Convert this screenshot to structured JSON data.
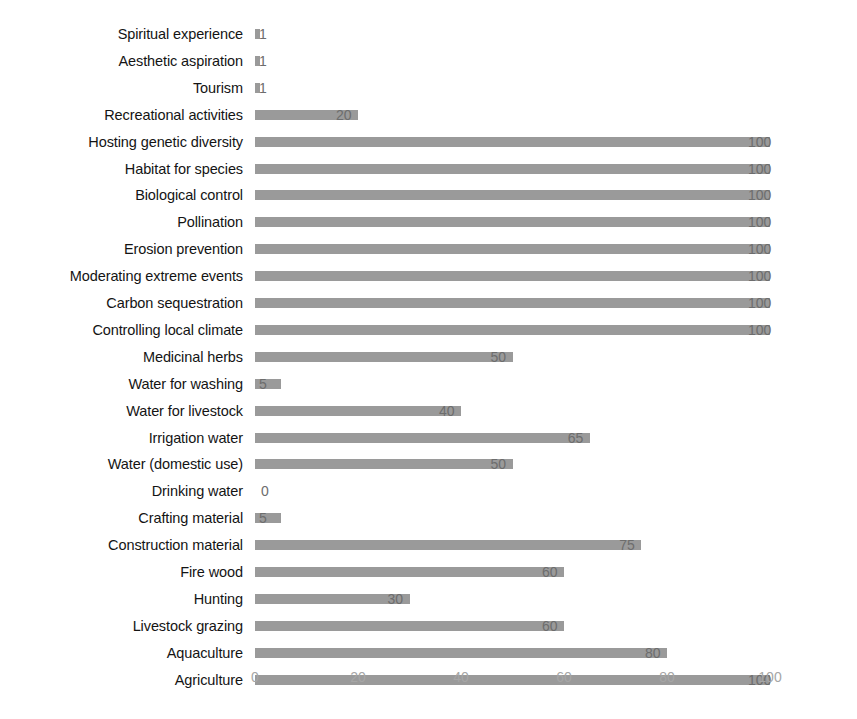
{
  "chart_data": {
    "type": "bar",
    "orientation": "horizontal",
    "title": "",
    "xlabel": "",
    "ylabel": "",
    "xlim": [
      0,
      100
    ],
    "xticks": [
      "0",
      "20",
      "40",
      "60",
      "80",
      "100"
    ],
    "xtick_values": [
      0,
      20,
      40,
      60,
      80,
      100
    ],
    "grid": false,
    "legend": false,
    "bar_color": "#9a9a9a",
    "label_color": "#141414",
    "value_label_color": "#6d6d6d",
    "tick_label_color": "#a6a6a6",
    "categories": [
      "Spiritual experience",
      "Aesthetic aspiration",
      "Tourism",
      "Recreational activities",
      "Hosting genetic diversity",
      "Habitat for species",
      "Biological control",
      "Pollination",
      "Erosion prevention",
      "Moderating extreme events",
      "Carbon sequestration",
      "Controlling local climate",
      "Medicinal herbs",
      "Water for washing",
      "Water for livestock",
      "Irrigation water",
      "Water (domestic use)",
      "Drinking water",
      "Crafting material",
      "Construction material",
      "Fire wood",
      "Hunting",
      "Livestock grazing",
      "Aquaculture",
      "Agriculture"
    ],
    "values": [
      1,
      1,
      1,
      20,
      100,
      100,
      100,
      100,
      100,
      100,
      100,
      100,
      50,
      5,
      40,
      65,
      50,
      0,
      5,
      75,
      60,
      30,
      60,
      80,
      100
    ],
    "value_labels": [
      "1",
      "1",
      "1",
      "20",
      "100",
      "100",
      "100",
      "100",
      "100",
      "100",
      "100",
      "100",
      "50",
      "5",
      "40",
      "65",
      "50",
      "0",
      "5",
      "75",
      "60",
      "30",
      "60",
      "80",
      "100"
    ]
  }
}
